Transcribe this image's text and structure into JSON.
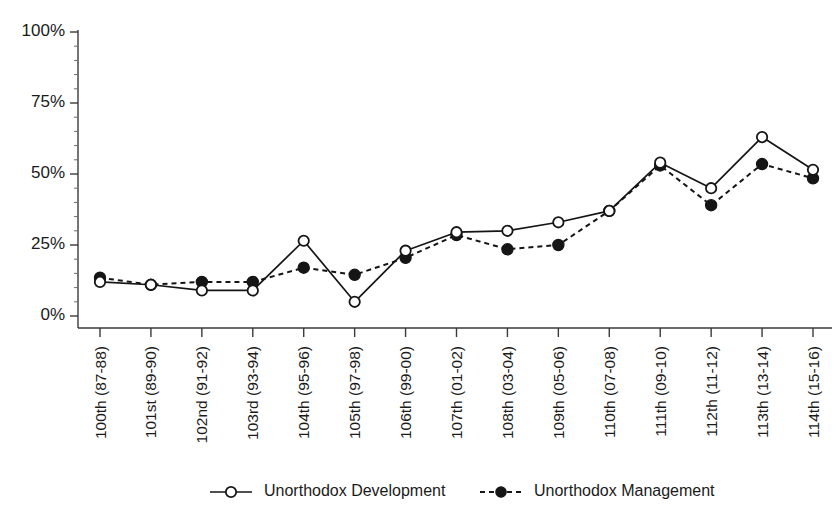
{
  "chart_data": {
    "type": "line",
    "title": "",
    "subtitle": "",
    "xlabel": "",
    "ylabel": "",
    "ylim": [
      0,
      100
    ],
    "yticks": [
      0,
      25,
      50,
      75,
      100
    ],
    "ytick_labels": [
      "0%",
      "25%",
      "50%",
      "75%",
      "100%"
    ],
    "grid": false,
    "legend_position": "bottom",
    "minor_ticks_per_interval": 5,
    "categories": [
      "100th (87-88)",
      "101st (89-90)",
      "102nd (91-92)",
      "103rd (93-94)",
      "104th (95-96)",
      "105th (97-98)",
      "106th (99-00)",
      "107th (01-02)",
      "108th (03-04)",
      "109th (05-06)",
      "110th (07-08)",
      "111th (09-10)",
      "112th (11-12)",
      "113th (13-14)",
      "114th (15-16)"
    ],
    "series": [
      {
        "name": "Unorthodox Development",
        "line_style": "solid",
        "marker": "open-circle",
        "color": "#151515",
        "values": [
          12,
          11,
          9,
          9,
          26.5,
          5,
          23,
          29.5,
          30,
          33,
          37,
          54,
          45,
          63,
          51.5
        ]
      },
      {
        "name": "Unorthodox Management",
        "line_style": "dashed",
        "marker": "filled-circle",
        "color": "#151515",
        "values": [
          13.5,
          11,
          12,
          12,
          17,
          14.5,
          20.5,
          28.5,
          23.5,
          25,
          37,
          53,
          39,
          53.5,
          48.5
        ]
      }
    ]
  },
  "legend": {
    "items": [
      {
        "label": "Unorthodox Development",
        "style": "solid",
        "marker": "open-circle"
      },
      {
        "label": "Unorthodox Management",
        "style": "dashed",
        "marker": "filled-circle"
      }
    ]
  }
}
